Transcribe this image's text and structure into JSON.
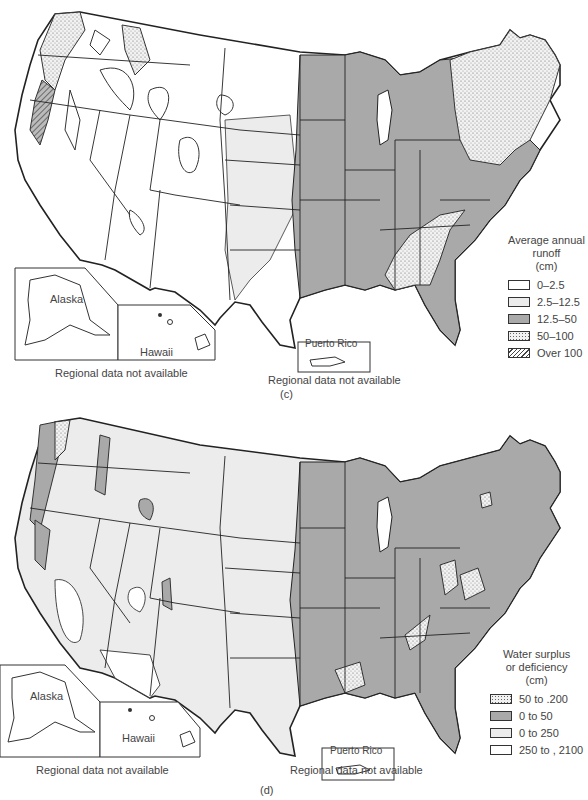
{
  "colors": {
    "white": "#ffffff",
    "light_gray": "#ececec",
    "medium_gray": "#a9a9a9",
    "outline": "#222222"
  },
  "panel_c": {
    "label": "(c)",
    "legend": {
      "title_line1": "Average annual",
      "title_line2": "runoff",
      "title_line3": "(cm)",
      "items": [
        {
          "label": "0–2.5",
          "pattern": "white"
        },
        {
          "label": "2.5–12.5",
          "pattern": "light"
        },
        {
          "label": "12.5–50",
          "pattern": "medium"
        },
        {
          "label": "50–100",
          "pattern": "stipple"
        },
        {
          "label": "Over 100",
          "pattern": "hatch"
        }
      ]
    },
    "insets": {
      "alaska": "Alaska",
      "hawaii": "Hawaii",
      "puerto_rico": "Puerto Rico"
    },
    "notes": {
      "left": "Regional data not available",
      "right": "Regional data not available"
    }
  },
  "panel_d": {
    "label": "(d)",
    "legend": {
      "title_line1": "Water surplus",
      "title_line2": "or deficiency",
      "title_line3": "(cm)",
      "items": [
        {
          "label": "50 to .200",
          "pattern": "stipple"
        },
        {
          "label": "0 to 50",
          "pattern": "medium"
        },
        {
          "label": "0 to 250",
          "pattern": "light"
        },
        {
          "label": "250 to , 2100",
          "pattern": "white"
        }
      ]
    },
    "insets": {
      "alaska": "Alaska",
      "hawaii": "Hawaii",
      "puerto_rico": "Puerto Rico"
    },
    "notes": {
      "left": "Regional data not available",
      "right": "Regional data not available"
    }
  }
}
